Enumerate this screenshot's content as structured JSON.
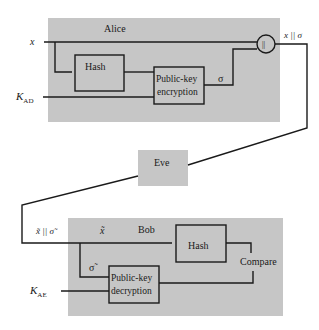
{
  "colors": {
    "panel": "#c6c6c6",
    "line": "#1a1a1a",
    "background": "#ffffff"
  },
  "alice": {
    "title": "Alice",
    "input_x": "x",
    "key_main": "K",
    "key_sub": "AD",
    "hash_label": "Hash",
    "encrypt_line1": "Public-key",
    "encrypt_line2": "encryption",
    "sigma": "σ",
    "concat_symbol": "||",
    "output": "x || σ"
  },
  "eve": {
    "title": "Eve"
  },
  "bob": {
    "title": "Bob",
    "input": "x̃ || σ̃",
    "x_tilde": "x̃",
    "sigma_tilde": "σ̃",
    "key_main": "K",
    "key_sub": "AE",
    "hash_label": "Hash",
    "decrypt_line1": "Public-key",
    "decrypt_line2": "decryption",
    "compare": "Compare"
  }
}
